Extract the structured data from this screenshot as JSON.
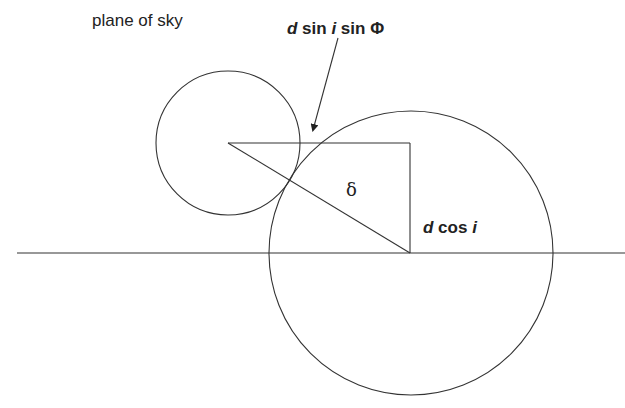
{
  "labels": {
    "plane_of_sky": "plane of sky",
    "top_formula": {
      "d": "d",
      "sin1": " sin ",
      "i": "i",
      "sin2": " sin ",
      "phi": "Φ"
    },
    "delta": "δ",
    "bottom_formula": {
      "d": "d",
      "cos": " cos ",
      "i": "i"
    }
  },
  "geometry": {
    "stroke_color": "#333333",
    "small_circle": {
      "cx": 228,
      "cy": 143,
      "r": 72
    },
    "large_circle": {
      "cx": 411,
      "cy": 253,
      "r": 142
    },
    "baseline": {
      "x1": 17,
      "y1": 253,
      "x2": 625,
      "y2": 253
    },
    "triangle": {
      "top_left": [
        228,
        143
      ],
      "top_right": [
        410,
        143
      ],
      "bottom_right": [
        410,
        253
      ]
    },
    "arrow": {
      "from": [
        338,
        38
      ],
      "to": [
        313,
        131
      ]
    }
  }
}
